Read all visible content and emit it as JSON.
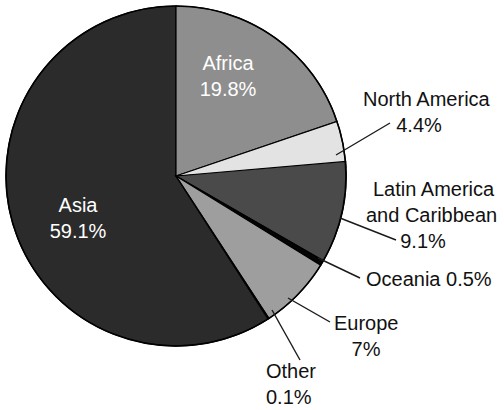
{
  "chart_data": {
    "type": "pie",
    "title": "",
    "subtitle": "",
    "xlabel": "",
    "ylabel": "",
    "legend_position": "none",
    "grid": false,
    "units": "percent",
    "start_angle_deg": 0,
    "direction": "clockwise",
    "categories": [
      "Africa",
      "North America",
      "Latin America and Caribbean",
      "Oceania",
      "Europe",
      "Other",
      "Asia"
    ],
    "values": [
      19.8,
      4.4,
      9.1,
      0.5,
      7.0,
      0.1,
      59.1
    ],
    "slices": [
      {
        "name": "Africa",
        "label_lines": [
          "Africa",
          "19.8%"
        ],
        "value": 19.8,
        "value_text": "19.8%",
        "color": "#8e8e8e",
        "label_placement": "inside",
        "label_color": "#ffffff"
      },
      {
        "name": "North America",
        "label_lines": [
          "North America",
          "4.4%"
        ],
        "value": 4.4,
        "value_text": "4.4%",
        "color": "#e3e3e3",
        "label_placement": "outside",
        "label_color": "#111111"
      },
      {
        "name": "Latin America and Caribbean",
        "label_lines": [
          "Latin America",
          "and Caribbean",
          "9.1%"
        ],
        "value": 9.1,
        "value_text": "9.1%",
        "color": "#4a4a4a",
        "label_placement": "outside",
        "label_color": "#111111"
      },
      {
        "name": "Oceania",
        "label_lines": [
          "Oceania 0.5%"
        ],
        "value": 0.5,
        "value_text": "0.5%",
        "color": "#050505",
        "label_placement": "outside",
        "label_color": "#111111"
      },
      {
        "name": "Europe",
        "label_lines": [
          "Europe",
          "7%"
        ],
        "value": 7.0,
        "value_text": "7%",
        "color": "#9e9e9e",
        "label_placement": "outside",
        "label_color": "#111111"
      },
      {
        "name": "Other",
        "label_lines": [
          "Other",
          "0.1%"
        ],
        "value": 0.1,
        "value_text": "0.1%",
        "color": "#f2f2f2",
        "label_placement": "outside",
        "label_color": "#111111"
      },
      {
        "name": "Asia",
        "label_lines": [
          "Asia",
          "59.1%"
        ],
        "value": 59.1,
        "value_text": "59.1%",
        "color": "#2b2b2b",
        "label_placement": "inside",
        "label_color": "#ffffff"
      }
    ]
  },
  "labels": {
    "africa_name": "Africa",
    "africa_value": "19.8%",
    "asia_name": "Asia",
    "asia_value": "59.1%",
    "north_america_name": "North America",
    "north_america_value": "4.4%",
    "latin_america_line1": "Latin America",
    "latin_america_line2": "and Caribbean",
    "latin_america_value": "9.1%",
    "oceania_combined": "Oceania 0.5%",
    "europe_name": "Europe",
    "europe_value": "7%",
    "other_name": "Other",
    "other_value": "0.1%"
  },
  "style": {
    "background": "#ffffff",
    "outline": "#000000",
    "text_dark": "#111111",
    "text_light": "#ffffff"
  }
}
